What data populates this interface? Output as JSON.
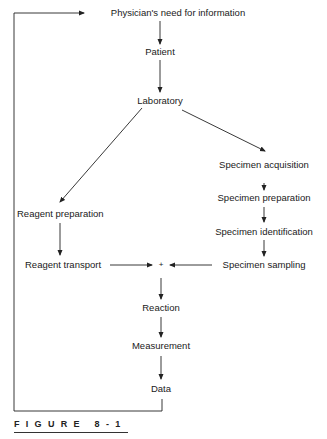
{
  "diagram": {
    "nodes": {
      "physician": "Physician's need for information",
      "patient": "Patient",
      "laboratory": "Laboratory",
      "reagent_preparation": "Reagent preparation",
      "reagent_transport": "Reagent transport",
      "specimen_acquisition": "Specimen acquisition",
      "specimen_preparation": "Specimen preparation",
      "specimen_identification": "Specimen identification",
      "specimen_sampling": "Specimen sampling",
      "combine": "+",
      "reaction": "Reaction",
      "measurement": "Measurement",
      "data": "Data"
    },
    "edges": [
      [
        "physician",
        "patient"
      ],
      [
        "patient",
        "laboratory"
      ],
      [
        "laboratory",
        "reagent_preparation"
      ],
      [
        "laboratory",
        "specimen_acquisition"
      ],
      [
        "specimen_acquisition",
        "specimen_preparation"
      ],
      [
        "specimen_preparation",
        "specimen_identification"
      ],
      [
        "specimen_identification",
        "specimen_sampling"
      ],
      [
        "reagent_preparation",
        "reagent_transport"
      ],
      [
        "reagent_transport",
        "combine"
      ],
      [
        "specimen_sampling",
        "combine"
      ],
      [
        "combine",
        "reaction"
      ],
      [
        "reaction",
        "measurement"
      ],
      [
        "measurement",
        "data"
      ],
      [
        "data",
        "physician"
      ]
    ]
  },
  "caption": {
    "label": "FIGURE 8-1"
  },
  "colors": {
    "line": "#222222",
    "text": "#1a1a1a",
    "background": "#ffffff"
  }
}
